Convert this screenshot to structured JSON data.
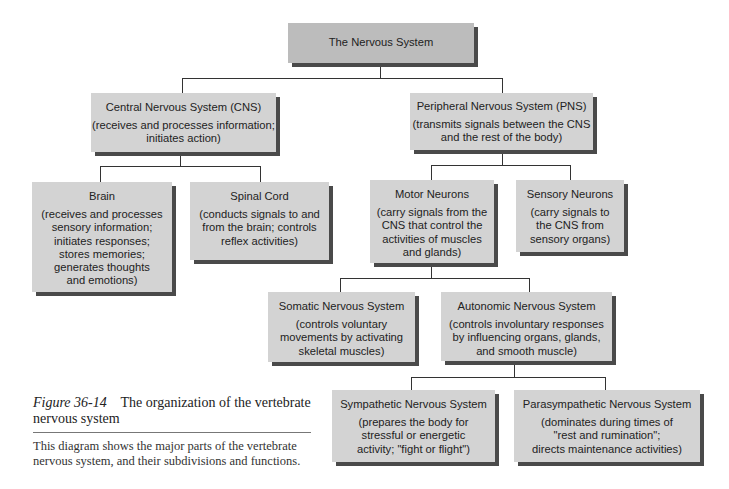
{
  "diagram": {
    "root": {
      "title": "The Nervous System"
    },
    "cns": {
      "title": "Central Nervous System (CNS)",
      "desc": "(receives and processes information;\ninitiates action)"
    },
    "pns": {
      "title": "Peripheral Nervous System (PNS)",
      "desc": "(transmits signals between the CNS\nand the rest of the body)"
    },
    "brain": {
      "title": "Brain",
      "desc": "(receives and processes\nsensory information;\ninitiates responses;\nstores memories;\ngenerates thoughts\nand emotions)"
    },
    "spinal_cord": {
      "title": "Spinal Cord",
      "desc": "(conducts signals to and\nfrom the brain; controls\nreflex activities)"
    },
    "motor_neurons": {
      "title": "Motor Neurons",
      "desc": "(carry signals from the\nCNS that control the\nactivities of muscles\nand glands)"
    },
    "sensory_neurons": {
      "title": "Sensory Neurons",
      "desc": "(carry signals to\nthe CNS from\nsensory organs)"
    },
    "somatic": {
      "title": "Somatic Nervous System",
      "desc": "(controls voluntary\nmovements by activating\nskeletal muscles)"
    },
    "autonomic": {
      "title": "Autonomic Nervous System",
      "desc": "(controls involuntary responses\nby influencing organs, glands,\nand smooth muscle)"
    },
    "sympathetic": {
      "title": "Sympathetic Nervous System",
      "desc": "(prepares the body for\nstressful or energetic\nactivity; \"fight or flight\")"
    },
    "parasympathetic": {
      "title": "Parasympathetic Nervous System",
      "desc": "(dominates during times of\n\"rest and rumination\";\ndirects maintenance activities)"
    }
  },
  "caption": {
    "figure_number": "Figure 36-14",
    "title": "The organization of the vertebrate nervous system",
    "body": "This diagram shows the major parts of the vertebrate nervous system, and their subdivisions and functions."
  },
  "colors": {
    "box_fill": "#d3d3d3",
    "root_fill": "#bcbcbc",
    "shadow": "#4a4a4a",
    "connector": "#333333"
  }
}
